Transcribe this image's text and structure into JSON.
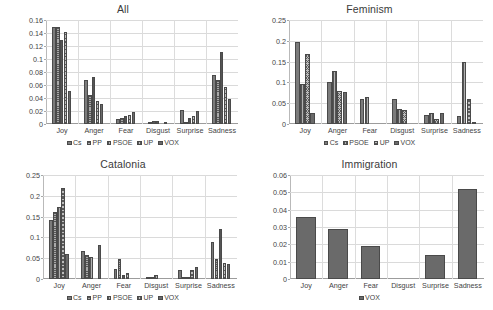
{
  "figure": {
    "panels": [
      {
        "id": "all",
        "title": "All",
        "categories": [
          "Joy",
          "Anger",
          "Fear",
          "Disgust",
          "Surprise",
          "Sadness"
        ],
        "ylim": [
          0,
          0.16
        ],
        "yticks": [
          "0",
          "0.02",
          "0.04",
          "0.06",
          "0.08",
          "0.1",
          "0.12",
          "0.14",
          "0.16"
        ],
        "ytick_values": [
          0,
          0.02,
          0.04,
          0.06,
          0.08,
          0.1,
          0.12,
          0.14,
          0.16
        ],
        "series": [
          {
            "name": "Cs",
            "values": [
              0.15,
              0.067,
              0.008,
              0.002,
              0.021,
              0.076
            ]
          },
          {
            "name": "PP",
            "values": [
              0.15,
              0.045,
              0.01,
              0.004,
              0.001,
              0.068
            ]
          },
          {
            "name": "PSOE",
            "values": [
              0.129,
              0.073,
              0.012,
              0.004,
              0.01,
              0.111
            ]
          },
          {
            "name": "UP",
            "values": [
              0.142,
              0.036,
              0.014,
              0.0,
              0.013,
              0.057
            ]
          },
          {
            "name": "VOX",
            "values": [
              0.051,
              0.031,
              0.019,
              0.002,
              0.02,
              0.038
            ]
          }
        ]
      },
      {
        "id": "feminism",
        "title": "Feminism",
        "categories": [
          "Joy",
          "Anger",
          "Fear",
          "Disgust",
          "Surprise",
          "Sadness"
        ],
        "ylim": [
          0,
          0.25
        ],
        "yticks": [
          "0",
          "0.05",
          "0.1",
          "0.15",
          "0.2",
          "0.25"
        ],
        "ytick_values": [
          0,
          0.05,
          0.1,
          0.15,
          0.2,
          0.25
        ],
        "series": [
          {
            "name": "Cs",
            "values": [
              0.196,
              0.101,
              0.059,
              0.059,
              0.021,
              0.019
            ]
          },
          {
            "name": "PSOE",
            "values": [
              0.096,
              0.128,
              0.064,
              0.037,
              0.027,
              0.15
            ]
          },
          {
            "name": "UP",
            "values": [
              0.169,
              0.08,
              0.0,
              0.034,
              0.011,
              0.059
            ]
          },
          {
            "name": "VOX",
            "values": [
              0.027,
              0.077,
              0.0,
              0.0,
              0.027,
              0.002
            ]
          }
        ]
      },
      {
        "id": "catalonia",
        "title": "Catalonia",
        "categories": [
          "Joy",
          "Anger",
          "Fear",
          "Disgust",
          "Surprise",
          "Sadness"
        ],
        "ylim": [
          0,
          0.25
        ],
        "yticks": [
          "0",
          "0.05",
          "0.1",
          "0.15",
          "0.2",
          "0.25"
        ],
        "ytick_values": [
          0,
          0.05,
          0.1,
          0.15,
          0.2,
          0.25
        ],
        "series": [
          {
            "name": "Cs",
            "values": [
              0.142,
              0.068,
              0.023,
              0.006,
              0.022,
              0.09
            ]
          },
          {
            "name": "PP",
            "values": [
              0.16,
              0.058,
              0.049,
              0.001,
              0.002,
              0.048
            ]
          },
          {
            "name": "PSOE",
            "values": [
              0.172,
              0.052,
              0.009,
              0.009,
              0.001,
              0.121
            ]
          },
          {
            "name": "UP",
            "values": [
              0.219,
              0.0,
              0.014,
              0.0,
              0.022,
              0.038
            ]
          },
          {
            "name": "VOX",
            "values": [
              0.059,
              0.081,
              0.0,
              0.0,
              0.03,
              0.035
            ]
          }
        ]
      },
      {
        "id": "immigration",
        "title": "Immigration",
        "categories": [
          "Joy",
          "Anger",
          "Fear",
          "Disgust",
          "Surprise",
          "Sadness"
        ],
        "ylim": [
          0,
          0.06
        ],
        "yticks": [
          "0",
          "0.01",
          "0.02",
          "0.03",
          "0.04",
          "0.05",
          "0.06"
        ],
        "ytick_values": [
          0,
          0.01,
          0.02,
          0.03,
          0.04,
          0.05,
          0.06
        ],
        "series": [
          {
            "name": "VOX",
            "values": [
              0.036,
              0.029,
              0.019,
              0.0,
              0.014,
              0.052
            ]
          }
        ]
      }
    ],
    "series_styles": {
      "Cs": "solid-gray",
      "PP": "horizontal-hatch",
      "PSOE": "vertical-hatch",
      "UP": "diagonal-crosshatch",
      "VOX": "solid-dark-gray"
    },
    "colors": {
      "cs": "#7b7b7b",
      "pp": "#a9a9a9",
      "psoe": "#b0b0b0",
      "up": "#bdbdbd",
      "vox": "#6a6a6a",
      "grid": "#dadada",
      "axis": "#9c9c9c",
      "text": "#444444"
    },
    "chart_type": "bar",
    "legend_position": "bottom"
  },
  "chart_data": [
    {
      "type": "bar",
      "title": "All",
      "xlabel": "",
      "ylabel": "",
      "ylim": [
        0,
        0.16
      ],
      "grid": true,
      "legend_position": "bottom",
      "categories": [
        "Joy",
        "Anger",
        "Fear",
        "Disgust",
        "Surprise",
        "Sadness"
      ],
      "tick_labels": [
        "0",
        "0.02",
        "0.04",
        "0.06",
        "0.08",
        "0.1",
        "0.12",
        "0.14",
        "0.16"
      ],
      "series": [
        {
          "name": "Cs",
          "values": [
            0.15,
            0.067,
            0.008,
            0.002,
            0.021,
            0.076
          ]
        },
        {
          "name": "PP",
          "values": [
            0.15,
            0.045,
            0.01,
            0.004,
            0.001,
            0.068
          ]
        },
        {
          "name": "PSOE",
          "values": [
            0.129,
            0.073,
            0.012,
            0.004,
            0.01,
            0.111
          ]
        },
        {
          "name": "UP",
          "values": [
            0.142,
            0.036,
            0.014,
            0.0,
            0.013,
            0.057
          ]
        },
        {
          "name": "VOX",
          "values": [
            0.051,
            0.031,
            0.019,
            0.002,
            0.02,
            0.038
          ]
        }
      ]
    },
    {
      "type": "bar",
      "title": "Feminism",
      "xlabel": "",
      "ylabel": "",
      "ylim": [
        0,
        0.25
      ],
      "grid": true,
      "legend_position": "bottom",
      "categories": [
        "Joy",
        "Anger",
        "Fear",
        "Disgust",
        "Surprise",
        "Sadness"
      ],
      "tick_labels": [
        "0",
        "0.05",
        "0.1",
        "0.15",
        "0.2",
        "0.25"
      ],
      "series": [
        {
          "name": "Cs",
          "values": [
            0.196,
            0.101,
            0.059,
            0.059,
            0.021,
            0.019
          ]
        },
        {
          "name": "PSOE",
          "values": [
            0.096,
            0.128,
            0.064,
            0.037,
            0.027,
            0.15
          ]
        },
        {
          "name": "UP",
          "values": [
            0.169,
            0.08,
            0.0,
            0.034,
            0.011,
            0.059
          ]
        },
        {
          "name": "VOX",
          "values": [
            0.027,
            0.077,
            0.0,
            0.0,
            0.027,
            0.002
          ]
        }
      ]
    },
    {
      "type": "bar",
      "title": "Catalonia",
      "xlabel": "",
      "ylabel": "",
      "ylim": [
        0,
        0.25
      ],
      "grid": true,
      "legend_position": "bottom",
      "categories": [
        "Joy",
        "Anger",
        "Fear",
        "Disgust",
        "Surprise",
        "Sadness"
      ],
      "tick_labels": [
        "0",
        "0.05",
        "0.1",
        "0.15",
        "0.2",
        "0.25"
      ],
      "series": [
        {
          "name": "Cs",
          "values": [
            0.142,
            0.068,
            0.023,
            0.006,
            0.022,
            0.09
          ]
        },
        {
          "name": "PP",
          "values": [
            0.16,
            0.058,
            0.049,
            0.001,
            0.002,
            0.048
          ]
        },
        {
          "name": "PSOE",
          "values": [
            0.172,
            0.052,
            0.009,
            0.009,
            0.001,
            0.121
          ]
        },
        {
          "name": "UP",
          "values": [
            0.219,
            0.0,
            0.014,
            0.0,
            0.022,
            0.038
          ]
        },
        {
          "name": "VOX",
          "values": [
            0.059,
            0.081,
            0.0,
            0.0,
            0.03,
            0.035
          ]
        }
      ]
    },
    {
      "type": "bar",
      "title": "Immigration",
      "xlabel": "",
      "ylabel": "",
      "ylim": [
        0,
        0.06
      ],
      "grid": true,
      "legend_position": "bottom",
      "categories": [
        "Joy",
        "Anger",
        "Fear",
        "Disgust",
        "Surprise",
        "Sadness"
      ],
      "tick_labels": [
        "0",
        "0.01",
        "0.02",
        "0.03",
        "0.04",
        "0.05",
        "0.06"
      ],
      "series": [
        {
          "name": "VOX",
          "values": [
            0.036,
            0.029,
            0.019,
            0.0,
            0.014,
            0.052
          ]
        }
      ]
    }
  ]
}
